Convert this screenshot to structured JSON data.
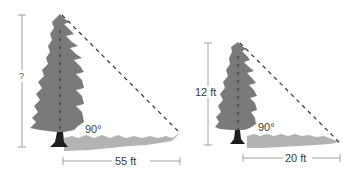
{
  "diagram": {
    "type": "similar-triangles-shadow-problem",
    "left_figure": {
      "height_label": "?",
      "shadow_label": "55 ft",
      "angle_label": "90°"
    },
    "right_figure": {
      "height_label": "12 ft",
      "shadow_label": "20 ft",
      "angle_label": "90°"
    },
    "colors": {
      "tree": "#7a7a7a",
      "shadow": "#b0b0b0",
      "trunk": "#1e1e1e",
      "line": "#9a9a9a",
      "dash": "#333333"
    }
  }
}
